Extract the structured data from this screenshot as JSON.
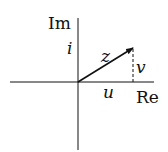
{
  "diagram": {
    "axes": {
      "real_label": "Re",
      "imag_label": "Im",
      "unit_imag_label": "i"
    },
    "vector": {
      "label": "z"
    },
    "components": {
      "real": "u",
      "imag": "v"
    },
    "colors": {
      "stroke": "#111111",
      "background": "#ffffff"
    }
  }
}
